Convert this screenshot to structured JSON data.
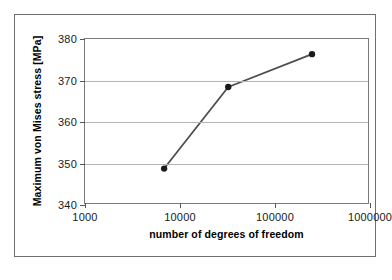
{
  "chart_data": {
    "type": "line",
    "title": "",
    "xlabel": "number of degrees of freedom",
    "ylabel": "Maximum von Mises stress [MPa]",
    "xscale": "log",
    "yscale": "linear",
    "xlim": [
      1000,
      1000000
    ],
    "ylim": [
      340,
      380
    ],
    "xticks": [
      1000,
      10000,
      100000,
      1000000
    ],
    "xticklabels": [
      "1000",
      "10000",
      "100000",
      "1000000"
    ],
    "yticks": [
      340,
      350,
      360,
      370,
      380
    ],
    "yticklabels": [
      "340",
      "350",
      "360",
      "370",
      "380"
    ],
    "grid": "horizontal",
    "legend": "none",
    "series": [
      {
        "name": "Maximum von Mises stress",
        "marker": "filled-circle",
        "marker_color": "#1a1a1a",
        "line_color": "#4d4d4d",
        "x": [
          6900,
          33000,
          255000
        ],
        "y": [
          348.4,
          368.3,
          376.3
        ]
      }
    ]
  },
  "colors": {
    "frame_border": "#6e6e6e",
    "plot_border": "#7a7a7a",
    "gridline": "#b4b4b4",
    "axis_text": "#1a1a1a",
    "background": "#ffffff"
  }
}
